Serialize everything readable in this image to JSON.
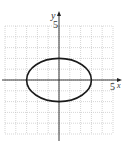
{
  "chart_data": {
    "type": "line",
    "title": "",
    "xlabel": "x",
    "ylabel": "y",
    "xlim": [
      -5,
      5
    ],
    "ylim": [
      -5,
      5
    ],
    "grid": true,
    "grid_step": 1,
    "tick_labels": {
      "x": [
        "5"
      ],
      "y": [
        "5"
      ]
    },
    "series": [
      {
        "name": "ellipse",
        "equation": "x^2/9 + y^2/4 = 1",
        "center": [
          0,
          0
        ],
        "semi_axis_x": 3,
        "semi_axis_y": 2,
        "color": "#1a1a1a"
      }
    ]
  },
  "labels": {
    "y_axis": "y",
    "x_axis": "x",
    "y_tick": "5",
    "x_tick": "5"
  },
  "colors": {
    "grid": "#b8b8b8",
    "axis": "#222222",
    "curve": "#1a1a1a"
  }
}
